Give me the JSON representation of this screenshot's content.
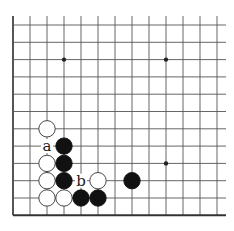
{
  "diagram": {
    "type": "go-board-fragment",
    "grid": {
      "columns": 13,
      "rows": 12,
      "origin_x": 13,
      "origin_y": 25,
      "spacing_x": 17.0,
      "spacing_y": 17.3,
      "line_color": "#555555",
      "edge_left": true,
      "edge_bottom": true
    },
    "star_points": [
      {
        "col": 3,
        "row": 2
      },
      {
        "col": 9,
        "row": 2
      },
      {
        "col": 9,
        "row": 8
      }
    ],
    "stones": [
      {
        "color": "white",
        "col": 2,
        "row": 6
      },
      {
        "color": "black",
        "col": 3,
        "row": 7
      },
      {
        "color": "white",
        "col": 2,
        "row": 8
      },
      {
        "color": "black",
        "col": 3,
        "row": 8
      },
      {
        "color": "white",
        "col": 2,
        "row": 9
      },
      {
        "color": "black",
        "col": 3,
        "row": 9
      },
      {
        "color": "white",
        "col": 5,
        "row": 9
      },
      {
        "color": "black",
        "col": 7,
        "row": 9
      },
      {
        "color": "white",
        "col": 2,
        "row": 10
      },
      {
        "color": "white",
        "col": 3,
        "row": 10
      },
      {
        "color": "black",
        "col": 4,
        "row": 10
      },
      {
        "color": "black",
        "col": 5,
        "row": 10
      }
    ],
    "labels": [
      {
        "text": "a",
        "col": 2,
        "row": 7
      },
      {
        "text": "b",
        "col": 4,
        "row": 9
      }
    ]
  }
}
